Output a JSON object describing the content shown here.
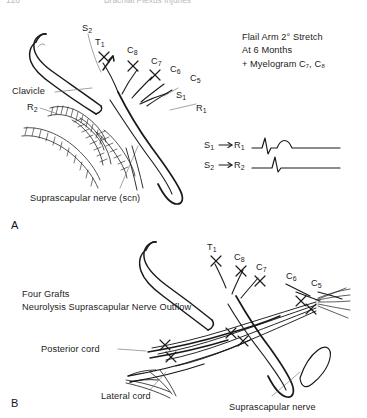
{
  "figure": {
    "background_color": "#ffffff",
    "ink_color": "#1a1a1a",
    "header": {
      "page_number": "126",
      "running_title": "Brachial Plexus Injuries"
    },
    "panels": [
      {
        "id": "A",
        "label": "A"
      },
      {
        "id": "B",
        "label": "B"
      }
    ]
  },
  "panel_a": {
    "letter": "A",
    "annotation_block": {
      "line1": "Flail Arm 2° Stretch",
      "line2": "At 6 Months",
      "line3": "+ Myelogram C₇, C₈"
    },
    "root_labels": [
      {
        "name": "S2",
        "text": "S",
        "sub": "2"
      },
      {
        "name": "T1",
        "text": "T",
        "sub": "1"
      },
      {
        "name": "C8",
        "text": "C",
        "sub": "8"
      },
      {
        "name": "C7",
        "text": "C",
        "sub": "7"
      },
      {
        "name": "C6",
        "text": "C",
        "sub": "6"
      },
      {
        "name": "C5",
        "text": "C",
        "sub": "5"
      },
      {
        "name": "S1",
        "text": "S",
        "sub": "1"
      },
      {
        "name": "R1",
        "text": "R",
        "sub": "1"
      },
      {
        "name": "R2",
        "text": "R",
        "sub": "2"
      }
    ],
    "structure_labels": [
      {
        "name": "clavicle",
        "text": "Clavicle"
      },
      {
        "name": "suprascapular-nerve",
        "text": "Suprascapular nerve (scn)"
      }
    ],
    "traces": [
      {
        "name": "trace-s1-r1",
        "stimulus": "S",
        "stimulus_sub": "1",
        "arrow": "→",
        "response": "R",
        "response_sub": "1",
        "waveform": "sharp-spike-plus-rounded-bump"
      },
      {
        "name": "trace-s2-r2",
        "stimulus": "S",
        "stimulus_sub": "2",
        "arrow": "→",
        "response": "R",
        "response_sub": "2",
        "waveform": "single-sharp-spike"
      }
    ]
  },
  "panel_b": {
    "letter": "B",
    "annotation_block": {
      "line1": "Four Grafts",
      "line2": "Neurolysis Suprascapular Nerve Outflow"
    },
    "root_labels": [
      {
        "name": "T1",
        "text": "T",
        "sub": "1"
      },
      {
        "name": "C8",
        "text": "C",
        "sub": "8"
      },
      {
        "name": "C7",
        "text": "C",
        "sub": "7"
      },
      {
        "name": "C6",
        "text": "C",
        "sub": "6"
      },
      {
        "name": "C5",
        "text": "C",
        "sub": "5"
      }
    ],
    "structure_labels": [
      {
        "name": "posterior-cord",
        "text": "Posterior cord"
      },
      {
        "name": "lateral-cord",
        "text": "Lateral cord"
      },
      {
        "name": "suprascapular-nerve",
        "text": "Suprascapular nerve"
      }
    ]
  }
}
